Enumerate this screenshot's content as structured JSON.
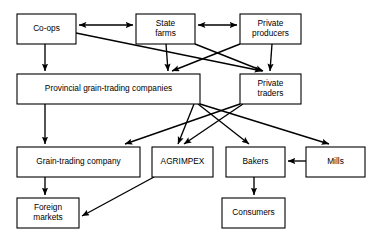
{
  "diagram": {
    "type": "flowchart",
    "canvas": {
      "width": 383,
      "height": 239
    },
    "style": {
      "background_color": "#ffffff",
      "box_fill": "#ffffff",
      "box_stroke": "#000000",
      "arrow_color": "#000000",
      "text_color": "#000000"
    },
    "nodes": [
      {
        "id": "co-ops",
        "label": "Co-ops",
        "lines": [
          "Co-ops"
        ],
        "x": 17,
        "y": 14,
        "w": 59,
        "h": 30
      },
      {
        "id": "state-farms",
        "label": "State farms",
        "lines": [
          "State",
          "farms"
        ],
        "x": 136,
        "y": 14,
        "w": 59,
        "h": 30
      },
      {
        "id": "private-producers",
        "label": "Private producers",
        "lines": [
          "Private",
          "producers"
        ],
        "x": 240,
        "y": 14,
        "w": 61,
        "h": 30
      },
      {
        "id": "provincial-grain-trading-companies",
        "label": "Provincial grain-trading companies",
        "lines": [
          "Provincial grain-trading companies"
        ],
        "x": 17,
        "y": 74,
        "w": 183,
        "h": 30
      },
      {
        "id": "private-traders",
        "label": "Private traders",
        "lines": [
          "Private",
          "traders"
        ],
        "x": 240,
        "y": 74,
        "w": 61,
        "h": 30
      },
      {
        "id": "grain-trading-company",
        "label": "Grain-trading company",
        "lines": [
          "Grain-trading company"
        ],
        "x": 17,
        "y": 147,
        "w": 123,
        "h": 30
      },
      {
        "id": "agrimpex",
        "label": "AGRIMPEX",
        "lines": [
          "AGRIMPEX"
        ],
        "x": 152,
        "y": 147,
        "w": 61,
        "h": 30
      },
      {
        "id": "bakers",
        "label": "Bakers",
        "lines": [
          "Bakers"
        ],
        "x": 226,
        "y": 147,
        "w": 59,
        "h": 30
      },
      {
        "id": "mills",
        "label": "Mills",
        "lines": [
          "Mills"
        ],
        "x": 306,
        "y": 147,
        "w": 59,
        "h": 30
      },
      {
        "id": "foreign-markets",
        "label": "Foreign markets",
        "lines": [
          "Foreign",
          "markets"
        ],
        "x": 17,
        "y": 198,
        "w": 62,
        "h": 30
      },
      {
        "id": "consumers",
        "label": "Consumers",
        "lines": [
          "Consumers"
        ],
        "x": 222,
        "y": 198,
        "w": 63,
        "h": 30
      }
    ],
    "edges": [
      {
        "id": "e1",
        "from": "co-ops",
        "to": "state-farms",
        "arrow": "both",
        "x1": 79,
        "y1": 25,
        "x2": 133,
        "y2": 25
      },
      {
        "id": "e2",
        "from": "state-farms",
        "to": "private-producers",
        "arrow": "both",
        "x1": 198,
        "y1": 25,
        "x2": 237,
        "y2": 25
      },
      {
        "id": "e3",
        "from": "co-ops",
        "to": "provincial-grain-trading-companies",
        "arrow": "end",
        "x1": 45,
        "y1": 44,
        "x2": 45,
        "y2": 71
      },
      {
        "id": "e4",
        "from": "co-ops",
        "to": "private-traders",
        "arrow": "end",
        "x1": 76,
        "y1": 33,
        "x2": 262,
        "y2": 71
      },
      {
        "id": "e5",
        "from": "state-farms",
        "to": "provincial-grain-trading-companies",
        "arrow": "end",
        "x1": 166,
        "y1": 44,
        "x2": 168,
        "y2": 71
      },
      {
        "id": "e6",
        "from": "state-farms",
        "to": "private-traders",
        "arrow": "end",
        "x1": 195,
        "y1": 44,
        "x2": 263,
        "y2": 71
      },
      {
        "id": "e7",
        "from": "private-producers",
        "to": "provincial-grain-trading-companies",
        "arrow": "end",
        "x1": 240,
        "y1": 44,
        "x2": 172,
        "y2": 71
      },
      {
        "id": "e8",
        "from": "private-producers",
        "to": "private-traders",
        "arrow": "end",
        "x1": 272,
        "y1": 44,
        "x2": 270,
        "y2": 71
      },
      {
        "id": "e9",
        "from": "provincial-grain-trading-companies",
        "to": "grain-trading-company",
        "arrow": "end",
        "x1": 45,
        "y1": 104,
        "x2": 45,
        "y2": 144
      },
      {
        "id": "e10",
        "from": "provincial-grain-trading-companies",
        "to": "agrimpex",
        "arrow": "end",
        "x1": 194,
        "y1": 104,
        "x2": 178,
        "y2": 144
      },
      {
        "id": "e11",
        "from": "provincial-grain-trading-companies",
        "to": "bakers",
        "arrow": "end",
        "x1": 198,
        "y1": 104,
        "x2": 249,
        "y2": 144
      },
      {
        "id": "e12",
        "from": "provincial-grain-trading-companies",
        "to": "mills",
        "arrow": "end",
        "x1": 200,
        "y1": 104,
        "x2": 329,
        "y2": 144
      },
      {
        "id": "e13",
        "from": "private-traders",
        "to": "grain-trading-company",
        "arrow": "end",
        "x1": 240,
        "y1": 104,
        "x2": 125,
        "y2": 144
      },
      {
        "id": "e14",
        "from": "private-traders",
        "to": "agrimpex",
        "arrow": "end",
        "x1": 243,
        "y1": 104,
        "x2": 184,
        "y2": 144
      },
      {
        "id": "e15",
        "from": "mills",
        "to": "bakers",
        "arrow": "end",
        "x1": 306,
        "y1": 161,
        "x2": 288,
        "y2": 161
      },
      {
        "id": "e16",
        "from": "grain-trading-company",
        "to": "foreign-markets",
        "arrow": "end",
        "x1": 45,
        "y1": 177,
        "x2": 45,
        "y2": 195
      },
      {
        "id": "e17",
        "from": "agrimpex",
        "to": "foreign-markets",
        "arrow": "end",
        "x1": 154,
        "y1": 177,
        "x2": 82,
        "y2": 216
      },
      {
        "id": "e18",
        "from": "bakers",
        "to": "consumers",
        "arrow": "end",
        "x1": 254,
        "y1": 177,
        "x2": 254,
        "y2": 195
      }
    ]
  }
}
